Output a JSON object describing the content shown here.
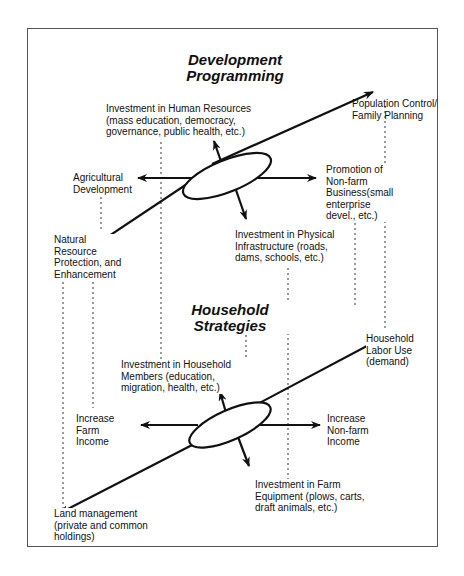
{
  "sections": {
    "top": {
      "title": "Development\nProgramming",
      "labels": {
        "human_resources": "Investment in Human Resources\n(mass education, democracy,\ngovernance, public health, etc.)",
        "population_control": "Population Control/\nFamily Planning",
        "agricultural_development": "Agricultural\nDevelopment",
        "non_farm_business": "Promotion of\nNon-farm\nBusiness(small\nenterprise\ndevel., etc.)",
        "natural_resource": "Natural\nResource\nProtection, and\nEnhancement",
        "physical_infrastructure": "Investment in Physical\nInfrastructure (roads,\ndams, schools, etc.)"
      }
    },
    "bottom": {
      "title": "Household\nStrategies",
      "labels": {
        "household_labor": "Household\nLabor Use\n(demand)",
        "household_members": "Investment in Household\nMembers (education,\nmigration, health, etc.)",
        "increase_farm_income": "Increase\nFarm\nIncome",
        "increase_non_farm_income": "Increase\nNon-farm\nIncome",
        "farm_equipment": "Investment in Farm\nEquipment (plows, carts,\ndraft animals, etc.)",
        "land_management": "Land management\n(private and common\nholdings)"
      }
    }
  },
  "colors": {
    "line": "#111111",
    "frame": "#555555",
    "dotted": "#333333"
  }
}
